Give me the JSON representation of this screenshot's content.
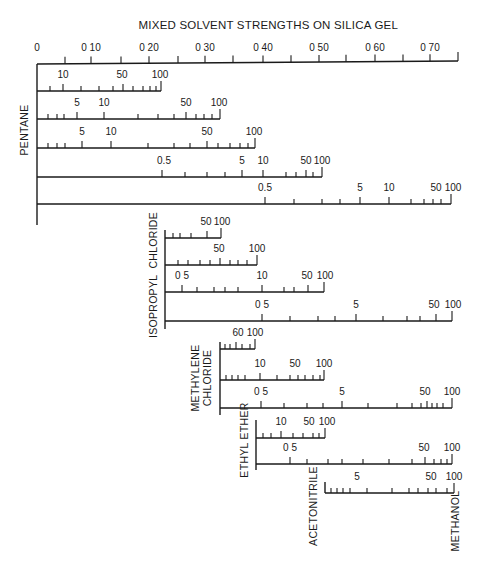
{
  "title": "MIXED SOLVENT STRENGTHS ON SILICA GEL",
  "colors": {
    "ink": "#1a1a1a",
    "background": "#ffffff"
  },
  "main_axis": {
    "name": "solvent-strength-axis",
    "x0": 37,
    "y0": 64,
    "x1": 458,
    "y1": 61,
    "ticks": [
      {
        "x": 37,
        "label": "0"
      },
      {
        "x": 65,
        "label": ""
      },
      {
        "x": 91,
        "label": "0 10"
      },
      {
        "x": 121,
        "label": ""
      },
      {
        "x": 149,
        "label": "0 20"
      },
      {
        "x": 178,
        "label": ""
      },
      {
        "x": 205,
        "label": "0 30"
      },
      {
        "x": 233,
        "label": ""
      },
      {
        "x": 263,
        "label": "0 40"
      },
      {
        "x": 291,
        "label": ""
      },
      {
        "x": 319,
        "label": "0 50"
      },
      {
        "x": 346,
        "label": ""
      },
      {
        "x": 375,
        "label": "0 60"
      },
      {
        "x": 403,
        "label": ""
      },
      {
        "x": 430,
        "label": "0 70"
      },
      {
        "x": 458,
        "label": ""
      }
    ]
  },
  "solvents": [
    {
      "name": "PENTANE",
      "axis": {
        "x": 37,
        "y_top": 64,
        "y_bottom": 225
      },
      "label_pos": {
        "x": 28,
        "y": 130
      },
      "scales": [
        {
          "y": 91,
          "x_end": 161,
          "ticks": [
            50,
            63,
            81,
            99,
            113,
            123,
            133,
            143,
            150,
            156,
            161
          ],
          "labels": [
            {
              "x": 63,
              "text": "10"
            },
            {
              "x": 122,
              "text": "50"
            },
            {
              "x": 160,
              "text": "100"
            }
          ]
        },
        {
          "y": 119,
          "x_end": 220,
          "ticks": [
            48,
            57,
            64,
            77,
            104,
            138,
            158,
            174,
            186,
            196,
            204,
            212,
            220
          ],
          "labels": [
            {
              "x": 77,
              "text": "5"
            },
            {
              "x": 104,
              "text": "10"
            },
            {
              "x": 186,
              "text": "50"
            },
            {
              "x": 219,
              "text": "100"
            }
          ]
        },
        {
          "y": 148,
          "x_end": 255,
          "ticks": [
            48,
            57,
            65,
            82,
            111,
            148,
            174,
            190,
            207,
            218,
            230,
            240,
            248,
            255
          ],
          "labels": [
            {
              "x": 82,
              "text": "5"
            },
            {
              "x": 111,
              "text": "10"
            },
            {
              "x": 207,
              "text": "50"
            },
            {
              "x": 254,
              "text": "100"
            }
          ]
        },
        {
          "y": 177,
          "x_end": 322,
          "ticks": [
            162,
            185,
            207,
            225,
            242,
            263,
            286,
            296,
            306,
            313,
            322
          ],
          "labels": [
            {
              "x": 164,
              "text": "0.5"
            },
            {
              "x": 242,
              "text": "5"
            },
            {
              "x": 263,
              "text": "10"
            },
            {
              "x": 306,
              "text": "50"
            },
            {
              "x": 322,
              "text": "100"
            }
          ]
        },
        {
          "y": 204,
          "x_end": 451,
          "ticks": [
            265,
            294,
            322,
            340,
            360,
            389,
            411,
            424,
            433,
            441,
            451
          ],
          "labels": [
            {
              "x": 265,
              "text": "0.5"
            },
            {
              "x": 360,
              "text": "5"
            },
            {
              "x": 389,
              "text": "10"
            },
            {
              "x": 436,
              "text": "50"
            },
            {
              "x": 453,
              "text": "100"
            }
          ]
        }
      ]
    },
    {
      "name": "ISOPROPYL  CHLORIDE",
      "axis": {
        "x": 165,
        "y_top": 230,
        "y_bottom": 329
      },
      "label_pos": {
        "x": 157,
        "y": 275
      },
      "scales": [
        {
          "y": 238,
          "x_end": 221,
          "ticks": [
            173,
            180,
            191,
            207,
            221
          ],
          "labels": [
            {
              "x": 206,
              "text": "50"
            },
            {
              "x": 222,
              "text": "100"
            }
          ]
        },
        {
          "y": 265,
          "x_end": 257,
          "ticks": [
            178,
            188,
            200,
            210,
            220,
            230,
            238,
            247,
            257
          ],
          "labels": [
            {
              "x": 219,
              "text": "50"
            },
            {
              "x": 257,
              "text": "100"
            }
          ]
        },
        {
          "y": 292,
          "x_end": 324,
          "ticks": [
            182,
            197,
            214,
            225,
            238,
            262,
            284,
            294,
            308,
            324
          ],
          "labels": [
            {
              "x": 182,
              "text": "0 5"
            },
            {
              "x": 262,
              "text": "10"
            },
            {
              "x": 307,
              "text": "50"
            },
            {
              "x": 325,
              "text": "100"
            }
          ]
        },
        {
          "y": 321,
          "x_end": 452,
          "ticks": [
            262,
            290,
            318,
            335,
            356,
            383,
            407,
            420,
            436,
            452
          ],
          "labels": [
            {
              "x": 262,
              "text": "0 5"
            },
            {
              "x": 356,
              "text": "5"
            },
            {
              "x": 434,
              "text": "50"
            },
            {
              "x": 453,
              "text": "100"
            }
          ]
        }
      ]
    },
    {
      "name": "METHYLENE",
      "name2": "CHLORIDE",
      "axis": {
        "x": 220,
        "y_top": 342,
        "y_bottom": 415
      },
      "label_pos": {
        "x": 205,
        "y": 378
      },
      "scales": [
        {
          "y": 349,
          "x_end": 255,
          "ticks": [
            225,
            230,
            236,
            242,
            250,
            255
          ],
          "labels": [
            {
              "x": 238,
              "text": "60"
            },
            {
              "x": 255,
              "text": "100"
            }
          ]
        },
        {
          "y": 380,
          "x_end": 324,
          "ticks": [
            226,
            232,
            238,
            245,
            260,
            277,
            290,
            298,
            305,
            313,
            320,
            324
          ],
          "labels": [
            {
              "x": 260,
              "text": "10"
            },
            {
              "x": 295,
              "text": "50"
            },
            {
              "x": 324,
              "text": "100"
            }
          ]
        },
        {
          "y": 408,
          "x_end": 452,
          "ticks": [
            261,
            284,
            307,
            323,
            342,
            368,
            397,
            412,
            421,
            427,
            432,
            437,
            443,
            452
          ],
          "labels": [
            {
              "x": 261,
              "text": "0 5"
            },
            {
              "x": 342,
              "text": "5"
            },
            {
              "x": 425,
              "text": "50"
            },
            {
              "x": 452,
              "text": "100"
            }
          ]
        }
      ]
    },
    {
      "name": "ETHYL ETHER",
      "axis": {
        "x": 256,
        "y_top": 420,
        "y_bottom": 470
      },
      "label_pos": {
        "x": 248,
        "y": 440
      },
      "scales": [
        {
          "y": 438,
          "x_end": 325,
          "ticks": [
            263,
            271,
            281,
            293,
            303,
            313,
            319,
            325
          ],
          "labels": [
            {
              "x": 281,
              "text": "10"
            },
            {
              "x": 309,
              "text": "50"
            },
            {
              "x": 327,
              "text": "100"
            }
          ]
        },
        {
          "y": 464,
          "x_end": 452,
          "ticks": [
            290,
            307,
            328,
            342,
            363,
            389,
            412,
            425,
            434,
            441,
            447,
            452
          ],
          "labels": [
            {
              "x": 290,
              "text": "0 5"
            },
            {
              "x": 424,
              "text": "50"
            },
            {
              "x": 452,
              "text": "100"
            }
          ]
        }
      ]
    },
    {
      "name": "ACETONITRILE",
      "axis": {
        "x": 325,
        "y_top": 482,
        "y_bottom": 493
      },
      "label_pos": {
        "x": 317,
        "y": 506
      },
      "scales": [
        {
          "y": 493,
          "x_end": 454,
          "ticks": [
            331,
            337,
            343,
            350,
            367,
            392,
            409,
            418,
            428,
            436,
            447,
            454
          ],
          "labels": [
            {
              "x": 357,
              "text": "5"
            },
            {
              "x": 431,
              "text": "50"
            },
            {
              "x": 454,
              "text": "100"
            }
          ]
        }
      ]
    }
  ],
  "terminal_label": {
    "name": "METHANOL",
    "x": 455,
    "y": 521
  }
}
